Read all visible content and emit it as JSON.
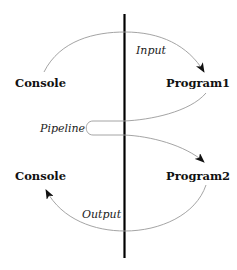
{
  "diagram": {
    "nodes": {
      "console_top": "Console",
      "program1": "Program1",
      "console_bottom": "Console",
      "program2": "Program2"
    },
    "edges": {
      "input": "Input",
      "pipeline": "Pipeline",
      "output": "Output"
    },
    "colors": {
      "divider": "#000000",
      "arrow_line": "#9a9a9a",
      "arrow_head": "#111111",
      "text": "#111111"
    }
  }
}
